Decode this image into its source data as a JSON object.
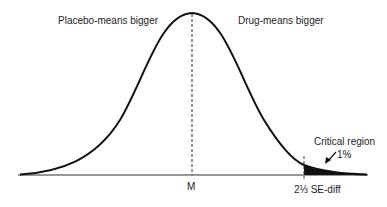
{
  "diagram": {
    "type": "normal-distribution-curve",
    "labels": {
      "left_region": "Placebo-means bigger",
      "right_region": "Drug-means bigger",
      "mean": "M",
      "critical_point": "2⅓ SE-diff",
      "critical_region": "Critical region",
      "critical_percent": "1%"
    },
    "colors": {
      "curve": "#111111",
      "shaded_region": "#111111",
      "background": "#ffffff"
    }
  }
}
